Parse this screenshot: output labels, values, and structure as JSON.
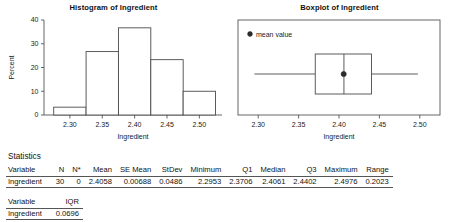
{
  "histogram": {
    "title": "Histogram of Ingredient",
    "ylabel": "Percent",
    "xlabel": "Ingredient"
  },
  "boxplot": {
    "title": "Boxplot of Ingredient",
    "xlabel": "Ingredient",
    "legend_label": "mean value"
  },
  "statistics": {
    "heading": "Statistics",
    "table1": {
      "headers": [
        "Variable",
        "N",
        "N*",
        "Mean",
        "SE Mean",
        "StDev",
        "Minimum",
        "Q1",
        "Median",
        "Q3",
        "Maximum",
        "Range"
      ],
      "rows": [
        [
          "Ingredient",
          "30",
          "0",
          "2.4058",
          "0.00688",
          "0.0486",
          "2.2953",
          "2.3706",
          "2.4061",
          "2.4402",
          "2.4976",
          "0.2023"
        ]
      ]
    },
    "table2": {
      "headers": [
        "Variable",
        "IQR"
      ],
      "rows": [
        [
          "Ingredient",
          "0.0696"
        ]
      ]
    }
  },
  "chart_data": [
    {
      "type": "bar",
      "title": "Histogram of Ingredient",
      "xlabel": "Ingredient",
      "ylabel": "Percent",
      "xlim": [
        2.26,
        2.535
      ],
      "ylim": [
        0,
        40
      ],
      "yticks": [
        0,
        10,
        20,
        30,
        40
      ],
      "xticks": [
        2.3,
        2.35,
        2.4,
        2.45,
        2.5
      ],
      "xticklabels": [
        "2.30",
        "2.35",
        "2.40",
        "2.45",
        "2.50"
      ],
      "grid": false,
      "legend": "none",
      "bin_edges": [
        2.275,
        2.325,
        2.375,
        2.425,
        2.475,
        2.525
      ],
      "categories": [
        "2.275-2.325",
        "2.325-2.375",
        "2.375-2.425",
        "2.425-2.475",
        "2.475-2.525"
      ],
      "values": [
        3.3,
        26.7,
        36.7,
        23.3,
        10.0
      ],
      "counts": [
        1,
        8,
        11,
        7,
        3
      ]
    },
    {
      "type": "boxplot",
      "title": "Boxplot of Ingredient",
      "xlabel": "Ingredient",
      "ylabel": "",
      "xlim": [
        2.275,
        2.525
      ],
      "xticks": [
        2.3,
        2.35,
        2.4,
        2.45,
        2.5
      ],
      "xticklabels": [
        "2.30",
        "2.35",
        "2.40",
        "2.45",
        "2.50"
      ],
      "grid": false,
      "legend": "mean value",
      "orientation": "horizontal",
      "minimum": 2.2953,
      "q1": 2.3706,
      "median": 2.4061,
      "q3": 2.4402,
      "maximum": 2.4976,
      "mean": 2.4058,
      "n": 30,
      "stdev": 0.0486,
      "se_mean": 0.00688,
      "range": 0.2023,
      "iqr": 0.0696
    }
  ]
}
